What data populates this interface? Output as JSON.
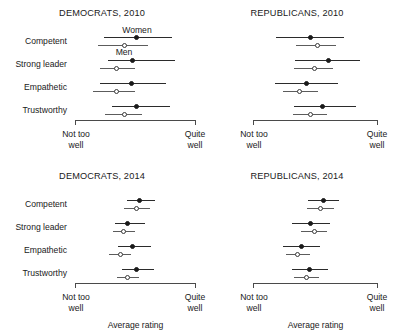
{
  "figure": {
    "axis_labels": {
      "left_line1": "Not too",
      "left_line2": "well",
      "right_line1": "Quite",
      "right_line2": "well",
      "axis_title": "Average rating"
    },
    "series_notes": {
      "women": "Women",
      "men": "Men"
    },
    "traits": [
      "Competent",
      "Strong leader",
      "Empathetic",
      "Trustworthy"
    ]
  },
  "chart_data": {
    "type": "scatter",
    "xlabel": "Average rating",
    "ylabel": "",
    "xlim": [
      0,
      1
    ],
    "xtick_labels": [
      "Not too well",
      "Quite well"
    ],
    "grid": false,
    "legend_position": "in-plot annotation (top-left panel)",
    "categories": [
      "Competent",
      "Strong leader",
      "Empathetic",
      "Trustworthy"
    ],
    "series_names": [
      "Women",
      "Men"
    ],
    "panels": [
      {
        "key": "tl",
        "title": "DEMOCRATS, 2010",
        "party": "Democrats",
        "year": 2010,
        "rows": [
          {
            "trait": "Competent",
            "women": {
              "value": 0.512,
              "low": 0.24,
              "high": 0.802
            },
            "men": {
              "value": 0.405,
              "low": 0.19,
              "high": 0.603
            }
          },
          {
            "trait": "Strong leader",
            "women": {
              "value": 0.479,
              "low": 0.273,
              "high": 0.826
            },
            "men": {
              "value": 0.347,
              "low": 0.207,
              "high": 0.496
            }
          },
          {
            "trait": "Empathetic",
            "women": {
              "value": 0.463,
              "low": 0.207,
              "high": 0.752
            },
            "men": {
              "value": 0.339,
              "low": 0.149,
              "high": 0.496
            }
          },
          {
            "trait": "Trustworthy",
            "women": {
              "value": 0.512,
              "low": 0.306,
              "high": 0.785
            },
            "men": {
              "value": 0.405,
              "low": 0.248,
              "high": 0.554
            }
          }
        ]
      },
      {
        "key": "tr",
        "title": "REPUBLICANS, 2010",
        "party": "Republicans",
        "year": 2010,
        "rows": [
          {
            "trait": "Competent",
            "women": {
              "value": 0.456,
              "low": 0.184,
              "high": 0.728
            },
            "men": {
              "value": 0.512,
              "low": 0.344,
              "high": 0.664
            }
          },
          {
            "trait": "Strong leader",
            "women": {
              "value": 0.6,
              "low": 0.336,
              "high": 0.856
            },
            "men": {
              "value": 0.488,
              "low": 0.328,
              "high": 0.64
            }
          },
          {
            "trait": "Empathetic",
            "women": {
              "value": 0.424,
              "low": 0.176,
              "high": 0.68
            },
            "men": {
              "value": 0.368,
              "low": 0.24,
              "high": 0.52
            }
          },
          {
            "trait": "Trustworthy",
            "women": {
              "value": 0.552,
              "low": 0.328,
              "high": 0.824
            },
            "men": {
              "value": 0.456,
              "low": 0.32,
              "high": 0.592
            }
          }
        ]
      },
      {
        "key": "bl",
        "title": "DEMOCRATS, 2014",
        "party": "Democrats",
        "year": 2014,
        "rows": [
          {
            "trait": "Competent",
            "women": {
              "value": 0.537,
              "low": 0.43,
              "high": 0.661
            },
            "men": {
              "value": 0.512,
              "low": 0.405,
              "high": 0.62
            }
          },
          {
            "trait": "Strong leader",
            "women": {
              "value": 0.438,
              "low": 0.331,
              "high": 0.579
            },
            "men": {
              "value": 0.397,
              "low": 0.314,
              "high": 0.496
            }
          },
          {
            "trait": "Empathetic",
            "women": {
              "value": 0.479,
              "low": 0.355,
              "high": 0.628
            },
            "men": {
              "value": 0.372,
              "low": 0.281,
              "high": 0.463
            }
          },
          {
            "trait": "Trustworthy",
            "women": {
              "value": 0.512,
              "low": 0.388,
              "high": 0.653
            },
            "men": {
              "value": 0.438,
              "low": 0.347,
              "high": 0.529
            }
          }
        ]
      },
      {
        "key": "br",
        "title": "REPUBLICANS, 2014",
        "party": "Republicans",
        "year": 2014,
        "rows": [
          {
            "trait": "Competent",
            "women": {
              "value": 0.56,
              "low": 0.44,
              "high": 0.688
            },
            "men": {
              "value": 0.536,
              "low": 0.432,
              "high": 0.648
            }
          },
          {
            "trait": "Strong leader",
            "women": {
              "value": 0.456,
              "low": 0.312,
              "high": 0.616
            },
            "men": {
              "value": 0.488,
              "low": 0.384,
              "high": 0.592
            }
          },
          {
            "trait": "Empathetic",
            "women": {
              "value": 0.384,
              "low": 0.24,
              "high": 0.536
            },
            "men": {
              "value": 0.352,
              "low": 0.264,
              "high": 0.456
            }
          },
          {
            "trait": "Trustworthy",
            "women": {
              "value": 0.448,
              "low": 0.312,
              "high": 0.6
            },
            "men": {
              "value": 0.424,
              "low": 0.328,
              "high": 0.528
            }
          }
        ]
      }
    ]
  }
}
